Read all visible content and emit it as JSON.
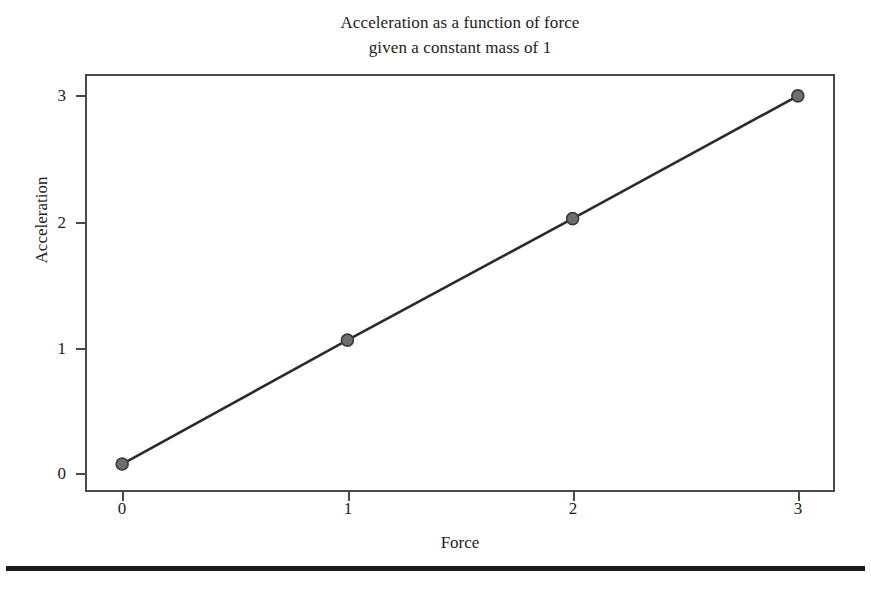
{
  "chart_data": {
    "type": "line",
    "title": "Acceleration as a function of force given a constant mass of 1",
    "title_lines": [
      "Acceleration as a function of force",
      "given a constant mass of 1"
    ],
    "xlabel": "Force",
    "ylabel": "Acceleration",
    "x": [
      0,
      1,
      2,
      3
    ],
    "values": [
      0.0,
      1.02,
      2.02,
      3.03
    ],
    "series": [
      {
        "name": "Acceleration",
        "x": [
          0,
          1,
          2,
          3
        ],
        "values": [
          0.0,
          1.02,
          2.02,
          3.03
        ]
      }
    ],
    "xlim": [
      -0.165,
      3.165
    ],
    "ylim": [
      -0.23,
      3.21
    ],
    "xticks": [
      0,
      1,
      2,
      3
    ],
    "yticks": [
      0,
      1,
      2,
      3
    ],
    "xtick_labels": [
      "0",
      "1",
      "2",
      "3"
    ],
    "ytick_labels": [
      "0",
      "1",
      "2",
      "3"
    ],
    "grid": false,
    "legend": null,
    "legend_position": "none",
    "marker": "circle",
    "marker_color": "#6e6e6e",
    "marker_edge_color": "#3a3a3a",
    "line_color": "#2b2b2b",
    "frame_color": "#4a4a4a",
    "background_color": "#ffffff"
  },
  "figure": {
    "page_rule_color": "#1a1a1a"
  }
}
